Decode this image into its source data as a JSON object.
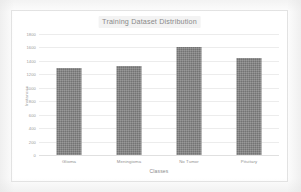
{
  "chart_data": {
    "type": "bar",
    "title": "Training Dataset Distribution",
    "xlabel": "Classes",
    "ylabel": "Instances",
    "categories": [
      "Glioma",
      "Meningioma",
      "No Tumor",
      "Pituitary"
    ],
    "values": [
      1300,
      1320,
      1600,
      1450
    ],
    "series": [
      {
        "name": "Instances",
        "values": [
          1300,
          1320,
          1600,
          1450
        ]
      }
    ],
    "ylim": [
      0,
      1800
    ],
    "ytick_step": 200,
    "yticks": [
      "1800",
      "1600",
      "1400",
      "1200",
      "1000",
      "800",
      "600",
      "400",
      "200",
      "0"
    ],
    "ytick_values": [
      1800,
      1600,
      1400,
      1200,
      1000,
      800,
      600,
      400,
      200,
      0
    ],
    "grid": "horizontal",
    "legend": "none",
    "bar_color": "#808080",
    "grid_color": "#ececec",
    "title_band_color": "#f3f3f3",
    "text_color": "#8f8f8f",
    "frame_color": "#e2e2e2"
  }
}
